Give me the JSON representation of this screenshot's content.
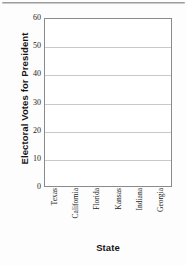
{
  "chart_data": {
    "type": "bar",
    "title": "",
    "xlabel": "State",
    "ylabel": "Electoral Votes for President",
    "categories": [
      "Texas",
      "California",
      "Florida",
      "Kansas",
      "Indiana",
      "Georgia"
    ],
    "values": [
      null,
      null,
      null,
      null,
      null,
      null
    ],
    "ylim": [
      0,
      60
    ],
    "yticks": [
      0,
      10,
      20,
      30,
      40,
      50,
      60
    ],
    "ytick_labels": [
      "0",
      "10",
      "20",
      "30",
      "40",
      "50",
      "60"
    ],
    "grid": "horizontal",
    "legend": "none",
    "note": "Empty axes template — no bars plotted"
  },
  "colors": {
    "plot_border": "#8a8a8a",
    "gridline": "#c9c9c9",
    "text": "#242424",
    "title_text": "#151515",
    "top_rule": "#8d8d8d",
    "background": "#fdfdfd"
  },
  "decor": {
    "top_rule_name": "page-divider-rule"
  }
}
